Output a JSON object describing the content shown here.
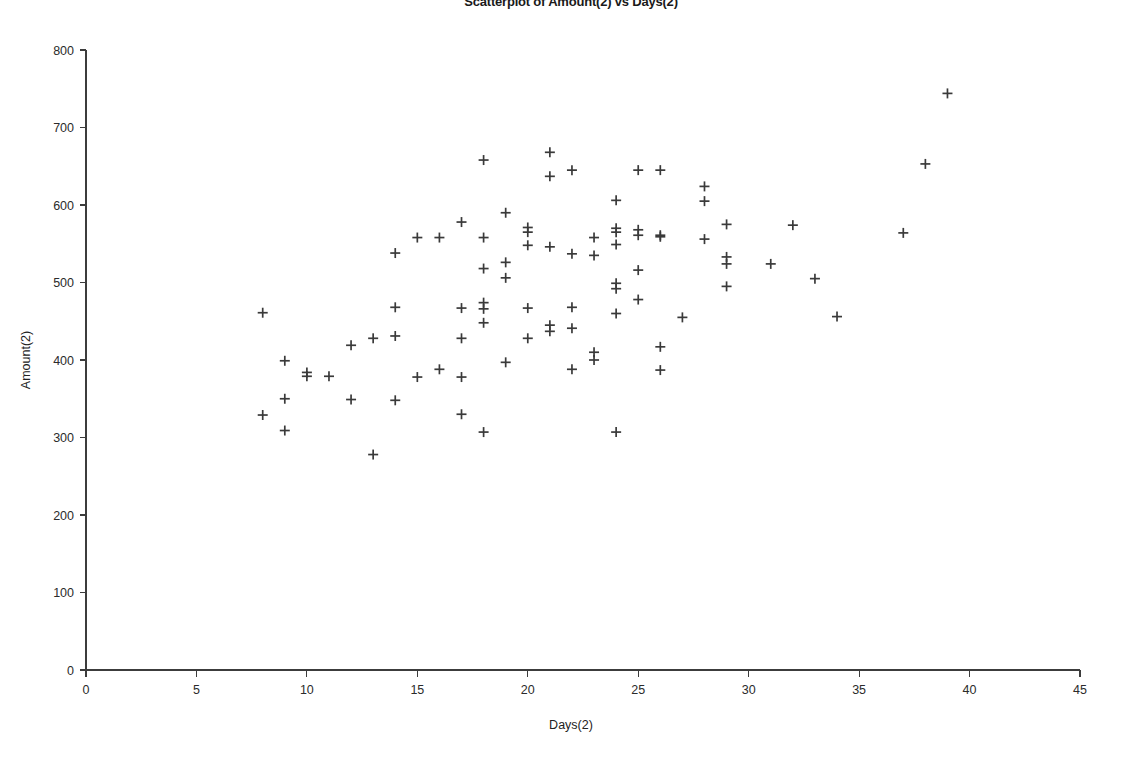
{
  "chart_data": {
    "type": "scatter",
    "title": "Scatterplot of Amount(2) vs Days(2)",
    "xlabel": "Days(2)",
    "ylabel": "Amount(2)",
    "xlim": [
      0,
      45
    ],
    "ylim": [
      0,
      800
    ],
    "xticks": [
      0,
      5,
      10,
      15,
      20,
      25,
      30,
      35,
      40,
      45
    ],
    "yticks": [
      0,
      100,
      200,
      300,
      400,
      500,
      600,
      700,
      800
    ],
    "grid": false,
    "legend": false,
    "marker": "plus",
    "marker_color": "#3a3a3a",
    "x": [
      8,
      8,
      9,
      9,
      9,
      10,
      10,
      11,
      12,
      12,
      13,
      13,
      14,
      14,
      14,
      14,
      15,
      15,
      16,
      16,
      17,
      17,
      17,
      17,
      17,
      18,
      18,
      18,
      18,
      18,
      18,
      18,
      19,
      19,
      19,
      19,
      20,
      20,
      20,
      20,
      20,
      21,
      21,
      21,
      21,
      21,
      22,
      22,
      22,
      22,
      22,
      23,
      23,
      23,
      23,
      24,
      24,
      24,
      24,
      24,
      24,
      24,
      24,
      25,
      25,
      25,
      25,
      25,
      26,
      26,
      26,
      26,
      26,
      27,
      28,
      28,
      28,
      29,
      29,
      29,
      29,
      31,
      32,
      33,
      34,
      37,
      38,
      39
    ],
    "y": [
      461,
      329,
      399,
      350,
      309,
      384,
      379,
      379,
      419,
      349,
      428,
      278,
      538,
      468,
      431,
      348,
      558,
      378,
      558,
      388,
      578,
      467,
      428,
      378,
      330,
      658,
      558,
      518,
      474,
      466,
      448,
      307,
      590,
      526,
      506,
      397,
      571,
      565,
      548,
      467,
      428,
      668,
      637,
      546,
      437,
      445,
      645,
      537,
      468,
      441,
      388,
      558,
      535,
      410,
      400,
      606,
      570,
      565,
      549,
      499,
      492,
      460,
      307,
      645,
      568,
      561,
      516,
      478,
      645,
      561,
      559,
      417,
      387,
      455,
      624,
      605,
      556,
      575,
      533,
      524,
      495,
      524,
      574,
      505,
      456,
      564,
      653,
      744
    ]
  }
}
